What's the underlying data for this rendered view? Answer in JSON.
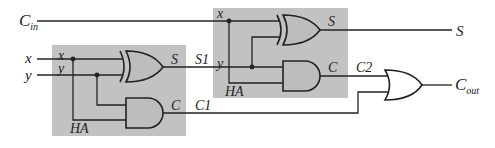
{
  "diagram": {
    "inputs": {
      "cin": {
        "main": "C",
        "sub": "in"
      },
      "x": "x",
      "y": "y"
    },
    "half_adder_1": {
      "label": "HA",
      "port_x": "x",
      "port_y": "y",
      "port_s": "S",
      "port_c": "C"
    },
    "half_adder_2": {
      "label": "HA",
      "port_x": "x",
      "port_y": "y",
      "port_s": "S",
      "port_c": "C"
    },
    "signals": {
      "s1": "S1",
      "c1": "C1",
      "c2": "C2"
    },
    "outputs": {
      "s": "S",
      "cout": {
        "main": "C",
        "sub": "out"
      }
    },
    "colors": {
      "box_fill": "#c2c2c2",
      "gate_fill": "#bdbdbd",
      "line": "#222222",
      "background": "#ffffff"
    }
  }
}
